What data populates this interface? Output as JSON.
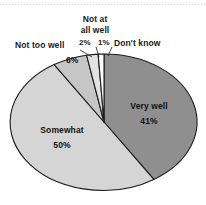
{
  "chart_data": {
    "type": "pie",
    "title": "",
    "subtitle": "",
    "xlabel": "",
    "ylabel": "",
    "legend_position": "none",
    "grid": false,
    "units": "percent",
    "total": 100,
    "categories": [
      "Very well",
      "Somewhat",
      "Not too well",
      "Not at all well",
      "Don't know"
    ],
    "values": [
      41,
      50,
      6,
      2,
      1
    ],
    "slices": [
      {
        "label": "Very well",
        "value": 41,
        "value_text": "41%",
        "color": "#8f8f8f",
        "label_placement": "inside"
      },
      {
        "label": "Somewhat",
        "value": 50,
        "value_text": "50%",
        "color": "#d5d5d5",
        "label_placement": "inside"
      },
      {
        "label": "Not too well",
        "value": 6,
        "value_text": "6%",
        "color": "#c6c6c6",
        "label_placement": "outside"
      },
      {
        "label": "Not at all well",
        "value": 2,
        "value_text": "2%",
        "color": "#e2e2e2",
        "label_placement": "outside"
      },
      {
        "label": "Don't know",
        "value": 1,
        "value_text": "1%",
        "color": "#ffffff",
        "label_placement": "outside"
      }
    ],
    "stroke_color": "#1c1c1c",
    "start_angle_deg": 0,
    "direction": "clockwise"
  },
  "labels": {
    "very_well_name": "Very well",
    "very_well_pct": "41%",
    "somewhat_name": "Somewhat",
    "somewhat_pct": "50%",
    "not_too_well_name": "Not too well",
    "not_too_well_pct": "6%",
    "not_at_all_well_line1": "Not at",
    "not_at_all_well_line2": "all well",
    "not_at_all_well_pct": "2%",
    "dont_know_pct": "1%",
    "dont_know_name": "Don't know"
  }
}
